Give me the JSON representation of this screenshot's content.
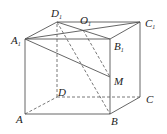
{
  "figure": {
    "labels": {
      "A": {
        "main": "A",
        "sub": ""
      },
      "B": {
        "main": "B",
        "sub": ""
      },
      "C": {
        "main": "C",
        "sub": ""
      },
      "D": {
        "main": "D",
        "sub": ""
      },
      "A1": {
        "main": "A",
        "sub": "1"
      },
      "B1": {
        "main": "B",
        "sub": "1"
      },
      "C1": {
        "main": "C",
        "sub": "1"
      },
      "D1": {
        "main": "D",
        "sub": "1"
      },
      "O1": {
        "main": "O",
        "sub": "1"
      },
      "M": {
        "main": "M",
        "sub": ""
      }
    },
    "solid_segments": [
      [
        "A",
        "B"
      ],
      [
        "B",
        "C"
      ],
      [
        "A",
        "A1"
      ],
      [
        "B",
        "B1"
      ],
      [
        "C",
        "C1"
      ],
      [
        "A1",
        "B1"
      ],
      [
        "B1",
        "C1"
      ],
      [
        "C1",
        "D1"
      ],
      [
        "D1",
        "A1"
      ],
      [
        "A1",
        "C1"
      ],
      [
        "D1",
        "B1"
      ],
      [
        "A1",
        "M"
      ]
    ],
    "dashed_segments": [
      [
        "A",
        "D"
      ],
      [
        "D",
        "C"
      ],
      [
        "D",
        "D1"
      ],
      [
        "D1",
        "B"
      ],
      [
        "O1",
        "M"
      ]
    ]
  }
}
